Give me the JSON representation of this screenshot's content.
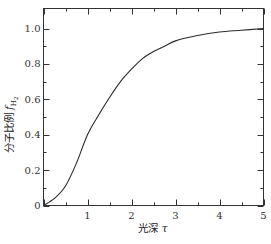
{
  "chart_data": {
    "type": "line",
    "title": "",
    "xlabel": "光深 τ",
    "ylabel": "分子比例 f_H2",
    "xlabel_parts": {
      "text": "光深 ",
      "symbol": "τ"
    },
    "ylabel_parts": {
      "text": "分子比例 ",
      "symbol": "f",
      "subscript": "H",
      "sub_subscript": "2"
    },
    "xlim": [
      0,
      5
    ],
    "ylim": [
      0,
      1.1
    ],
    "x_ticks": [
      0,
      1,
      2,
      3,
      4,
      5
    ],
    "x_tick_labels": [
      "",
      "1",
      "2",
      "3",
      "4",
      "5"
    ],
    "x_minor_ticks": [
      0.5,
      1.5,
      2.5,
      3.5,
      4.5
    ],
    "y_ticks": [
      0,
      0.2,
      0.4,
      0.6,
      0.8,
      1.0
    ],
    "y_tick_labels": [
      "0",
      "0.2",
      "0.4",
      "0.6",
      "0.8",
      "1.0"
    ],
    "y_minor_ticks": [
      0.1,
      0.3,
      0.5,
      0.7,
      0.9
    ],
    "grid": false,
    "legend": null,
    "series": [
      {
        "name": "f_H2",
        "x": [
          0,
          0.25,
          0.5,
          0.75,
          1.0,
          1.25,
          1.5,
          1.75,
          2.0,
          2.25,
          2.5,
          2.75,
          3.0,
          3.5,
          4.0,
          4.5,
          5.0
        ],
        "y": [
          0,
          0.04,
          0.11,
          0.24,
          0.4,
          0.51,
          0.61,
          0.7,
          0.77,
          0.83,
          0.87,
          0.9,
          0.93,
          0.96,
          0.98,
          0.99,
          1.0
        ]
      }
    ]
  }
}
